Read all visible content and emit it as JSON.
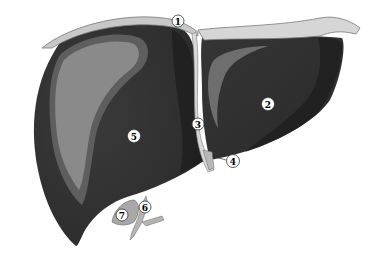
{
  "figure": {
    "callouts": [
      {
        "id": "1",
        "label": "1",
        "style": "light"
      },
      {
        "id": "2",
        "label": "2",
        "style": "on-dark"
      },
      {
        "id": "3",
        "label": "3",
        "style": "light"
      },
      {
        "id": "4",
        "label": "4",
        "style": "light"
      },
      {
        "id": "5",
        "label": "5",
        "style": "on-dark"
      },
      {
        "id": "6",
        "label": "6",
        "style": "light"
      },
      {
        "id": "7",
        "label": "7",
        "style": "light"
      }
    ],
    "colors": {
      "background": "#ffffff",
      "lobe_dark": "#2e2e2e",
      "lobe_mid": "#3a3a3a",
      "lobe_shadow": "#1c1c1c",
      "highlight_outer": "#6a6a6a",
      "highlight_inner": "#8e8e8e",
      "ligament": "#d8d8d8",
      "ligament_edge": "#8a8a8a",
      "gallbladder": "#a8a8a8",
      "callout_fill": "#ffffff",
      "callout_stroke": "#333333"
    }
  }
}
